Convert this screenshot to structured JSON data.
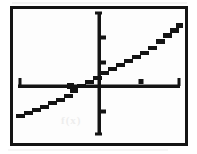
{
  "figure": {
    "kind": "graphing-calculator-screen",
    "frame_color": "#141414",
    "background_color": "#fdfdfd",
    "plot_color": "#141414",
    "artifact_color": "#ededed",
    "artifact_text": "f(x)"
  },
  "chart_data": {
    "type": "line",
    "title": "",
    "subtitle": "",
    "xlabel": "",
    "ylabel": "",
    "legend": [],
    "legend_position": "none",
    "grid": false,
    "axes": {
      "x_axis_visible": true,
      "y_axis_visible": true,
      "x_axis_pixel_y": 86,
      "y_axis_pixel_x": 99,
      "x_axis_pixel_start": 18,
      "x_axis_pixel_end": 180,
      "y_axis_pixel_start": 12,
      "y_axis_pixel_end": 135,
      "x_tick_pixels": [
        20,
        140,
        179
      ],
      "y_tick_pixels": [
        13,
        37,
        62,
        111,
        134
      ],
      "x_tick_labels": [],
      "y_tick_labels": [],
      "xlim": [
        -10,
        10
      ],
      "ylim": [
        -10,
        10
      ]
    },
    "series": [
      {
        "name": "line",
        "style": "pixelated-solid",
        "slope": 0.56,
        "y_intercept": 2.2,
        "x_intercept": -3.9,
        "pixel_start": [
          17,
          115
        ],
        "pixel_end": [
          178,
          25
        ],
        "x": [
          -10,
          -7.5,
          -5,
          -3.9,
          -2.5,
          0,
          2.5,
          5,
          7.5,
          10
        ],
        "values": [
          -3.4,
          -2.0,
          -0.6,
          0.0,
          0.8,
          2.2,
          3.6,
          5.0,
          6.4,
          7.8
        ]
      }
    ],
    "annotations": [
      {
        "name": "x-intercept-marker",
        "pixel": [
          70,
          86
        ],
        "label": ""
      }
    ]
  }
}
